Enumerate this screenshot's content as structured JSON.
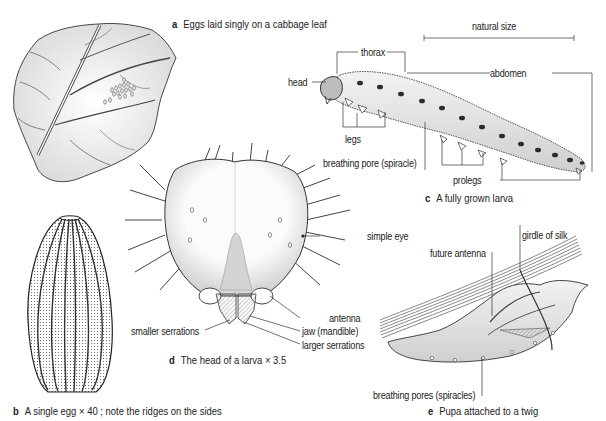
{
  "figure": {
    "panels": [
      {
        "letter": "a",
        "caption": "Eggs laid singly on a cabbage leaf"
      },
      {
        "letter": "b",
        "caption": "A single egg × 40 ; note the ridges on the sides"
      },
      {
        "letter": "c",
        "caption": "A fully grown larva"
      },
      {
        "letter": "d",
        "caption": "The head of a larva × 3.5"
      },
      {
        "letter": "e",
        "caption": "Pupa attached to a twig"
      }
    ],
    "larva_labels": {
      "natural_size": "natural size",
      "thorax": "thorax",
      "head": "head",
      "abdomen": "abdomen",
      "legs": "legs",
      "spiracle": "breathing pore (spiracle)",
      "prolegs": "prolegs"
    },
    "head_labels": {
      "simple_eye": "simple eye",
      "antenna": "antenna",
      "jaw": "jaw (mandible)",
      "smaller_serrations": "smaller serrations",
      "larger_serrations": "larger serrations"
    },
    "pupa_labels": {
      "girdle": "girdle of silk",
      "future_antenna": "future antenna",
      "spiracles": "breathing pores (spiracles)"
    }
  }
}
